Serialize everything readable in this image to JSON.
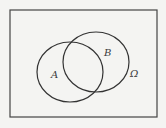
{
  "diagram": {
    "type": "venn",
    "universe_label": "Ω",
    "sets": [
      {
        "name": "A",
        "label": "A"
      },
      {
        "name": "B",
        "label": "B"
      }
    ],
    "stroke_color": "#333333",
    "background_color": "#f4f4f2"
  }
}
